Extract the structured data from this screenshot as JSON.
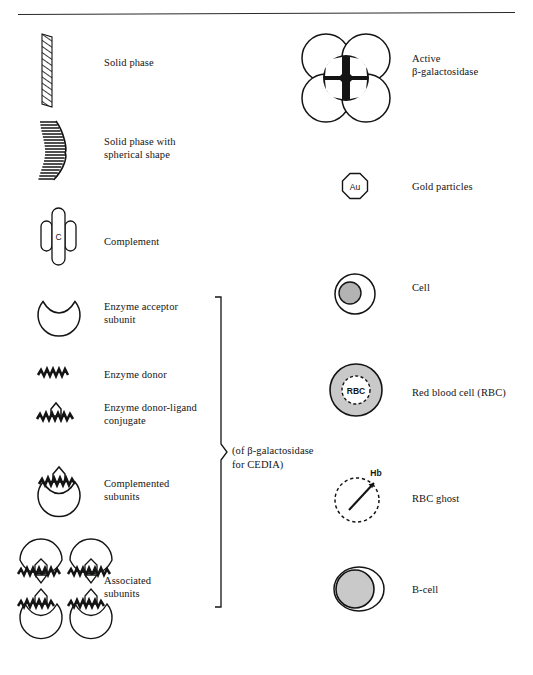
{
  "figure": {
    "has_top_rule": true,
    "background_color": "#ffffff",
    "ink_color": "#141414",
    "fill_gray": "#b3b3b3",
    "fill_gray_light": "#c9c9c9"
  },
  "left_column": {
    "items": [
      {
        "key": "solid-phase",
        "label": "Solid phase",
        "icon": "hatched-bar-icon"
      },
      {
        "key": "solid-phase-spherical",
        "label": "Solid phase with\nspherical shape",
        "icon": "hatched-arc-icon"
      },
      {
        "key": "complement",
        "label": "Complement",
        "icon": "complement-icon",
        "icon_text": "C"
      },
      {
        "key": "enzyme-acceptor",
        "label": "Enzyme acceptor\nsubunit",
        "icon": "notched-circle-icon"
      },
      {
        "key": "enzyme-donor",
        "label": "Enzyme donor",
        "icon": "zigzag-icon"
      },
      {
        "key": "enzyme-donor-ligand",
        "label": "Enzyme donor-ligand\nconjugate",
        "icon": "zigzag-ligand-icon"
      },
      {
        "key": "complemented-subunits",
        "label": "Complemented\nsubunits",
        "icon": "complemented-subunit-icon"
      },
      {
        "key": "associated-subunits",
        "label": "Associated\nsubunits",
        "icon": "associated-subunits-icon"
      }
    ]
  },
  "bracket_note": {
    "text": "(of β-galactosidase\nfor CEDIA)",
    "spans_items": [
      "enzyme-acceptor",
      "enzyme-donor",
      "enzyme-donor-ligand",
      "complemented-subunits",
      "associated-subunits"
    ]
  },
  "right_column": {
    "items": [
      {
        "key": "active-beta-gal",
        "label": "Active\nβ-galactosidase",
        "icon": "rosette-four-circles-icon"
      },
      {
        "key": "gold-particles",
        "label": "Gold particles",
        "icon": "octagon-icon",
        "icon_text": "Au"
      },
      {
        "key": "cell",
        "label": "Cell",
        "icon": "cell-icon"
      },
      {
        "key": "red-blood-cell",
        "label": "Red blood cell (RBC)",
        "icon": "rbc-icon",
        "icon_text": "RBC"
      },
      {
        "key": "rbc-ghost",
        "label": "RBC ghost",
        "icon": "rbc-ghost-icon",
        "icon_text": "Hb"
      },
      {
        "key": "b-cell",
        "label": "B-cell",
        "icon": "b-cell-icon"
      }
    ]
  }
}
